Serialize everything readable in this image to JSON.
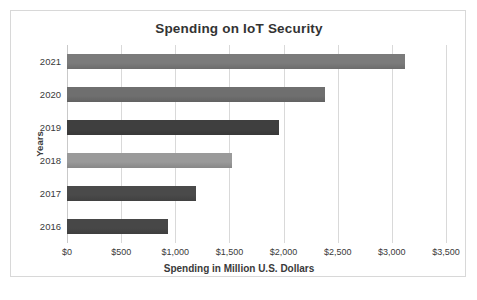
{
  "figure": {
    "caption": ""
  },
  "chart_data": {
    "type": "bar",
    "orientation": "horizontal",
    "title": "Spending on IoT Security",
    "xlabel": "Spending in Million U.S. Dollars",
    "ylabel": "Years",
    "categories": [
      "2021",
      "2020",
      "2019",
      "2018",
      "2017",
      "2016"
    ],
    "values": [
      3125,
      2385,
      1520,
      1960,
      1190,
      930
    ],
    "bars": [
      {
        "category": "2021",
        "value": 3125,
        "color": "#7b7b7b"
      },
      {
        "category": "2020",
        "value": 2385,
        "color": "#6f6f6f"
      },
      {
        "category": "2019",
        "value": 1960,
        "color": "#3f3f3f"
      },
      {
        "category": "2018",
        "value": 1520,
        "color": "#9a9a9a"
      },
      {
        "category": "2017",
        "value": 1190,
        "color": "#4a4a4a"
      },
      {
        "category": "2016",
        "value": 930,
        "color": "#474747"
      }
    ],
    "xlim": [
      0,
      3500
    ],
    "xticks": [
      0,
      500,
      1000,
      1500,
      2000,
      2500,
      3000,
      3500
    ],
    "xtick_labels": [
      "$0",
      "$500",
      "$1,000",
      "$1,500",
      "$2,000",
      "$2,500",
      "$3,000",
      "$3,500"
    ],
    "grid": true,
    "grid_axis": "x",
    "legend": false,
    "plot_background": "#ffffff",
    "grid_color": "#d9d9d9",
    "border_color": "#d8d8d8"
  }
}
